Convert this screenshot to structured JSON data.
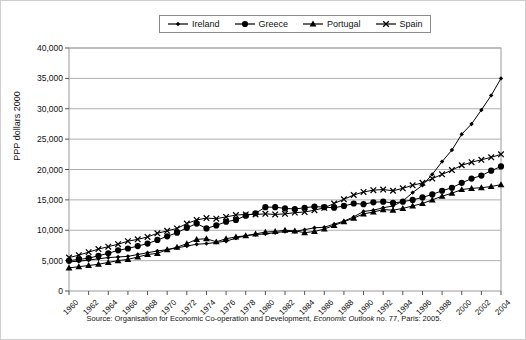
{
  "chart_data": {
    "type": "line",
    "title": "",
    "subtitle": "",
    "xlabel": "",
    "ylabel": "PPP dollars 2000",
    "xlim": [
      1960,
      2004
    ],
    "ylim": [
      0,
      40000
    ],
    "ytick_values": [
      0,
      5000,
      10000,
      15000,
      20000,
      25000,
      30000,
      35000,
      40000
    ],
    "ytick_labels": [
      "0",
      "5,000",
      "10,000",
      "15,000",
      "20,000",
      "25,000",
      "30,000",
      "35,000",
      "40,000"
    ],
    "xtick_labels": [
      "1960",
      "1962",
      "1964",
      "1966",
      "1968",
      "1970",
      "1972",
      "1974",
      "1976",
      "1978",
      "1980",
      "1982",
      "1984",
      "1986",
      "1988",
      "1990",
      "1992",
      "1994",
      "1996",
      "1998",
      "2000",
      "2002",
      "2004"
    ],
    "grid": "horizontal",
    "legend_position": "top-center",
    "x": [
      1960,
      1961,
      1962,
      1963,
      1964,
      1965,
      1966,
      1967,
      1968,
      1969,
      1970,
      1971,
      1972,
      1973,
      1974,
      1975,
      1976,
      1977,
      1978,
      1979,
      1980,
      1981,
      1982,
      1983,
      1984,
      1985,
      1986,
      1987,
      1988,
      1989,
      1990,
      1991,
      1992,
      1993,
      1994,
      1995,
      1996,
      1997,
      1998,
      1999,
      2000,
      2001,
      2002,
      2003,
      2004
    ],
    "series": [
      {
        "name": "Ireland",
        "marker": "diamond",
        "values": [
          4800,
          4900,
          5100,
          5300,
          5500,
          5600,
          5700,
          6000,
          6300,
          6600,
          6800,
          7100,
          7400,
          7700,
          7800,
          8000,
          8200,
          8700,
          9100,
          9300,
          9400,
          9600,
          9800,
          9800,
          10100,
          10400,
          10500,
          11000,
          11500,
          12200,
          13100,
          13300,
          13700,
          14000,
          14800,
          16200,
          17400,
          19200,
          21300,
          23200,
          25800,
          27500,
          29800,
          32200,
          35000
        ]
      },
      {
        "name": "Greece",
        "marker": "circle",
        "values": [
          5000,
          5200,
          5400,
          5800,
          6200,
          6700,
          7000,
          7400,
          7800,
          8400,
          9000,
          9600,
          10400,
          11100,
          10300,
          10800,
          11400,
          11700,
          12400,
          12800,
          13800,
          13800,
          13600,
          13500,
          13700,
          13900,
          13800,
          13700,
          14000,
          14400,
          14300,
          14600,
          14700,
          14500,
          14700,
          15000,
          15400,
          15900,
          16500,
          17000,
          17800,
          18500,
          19000,
          19800,
          20500
        ]
      },
      {
        "name": "Portugal",
        "marker": "triangle",
        "values": [
          3800,
          4000,
          4200,
          4400,
          4700,
          5000,
          5200,
          5600,
          6000,
          6200,
          6800,
          7200,
          7800,
          8500,
          8600,
          8100,
          8600,
          8900,
          9100,
          9400,
          9700,
          9800,
          10000,
          9900,
          9600,
          9800,
          10200,
          10800,
          11400,
          12000,
          12700,
          13000,
          13400,
          13300,
          13600,
          14000,
          14400,
          15000,
          15600,
          16100,
          16700,
          16900,
          17000,
          17200,
          17500
        ]
      },
      {
        "name": "Spain",
        "marker": "cross",
        "values": [
          5500,
          5900,
          6400,
          6900,
          7300,
          7700,
          8200,
          8500,
          8900,
          9500,
          9900,
          10300,
          11100,
          11700,
          12000,
          11900,
          12200,
          12500,
          12600,
          12600,
          12700,
          12600,
          12700,
          12900,
          13000,
          13300,
          13700,
          14400,
          15100,
          15800,
          16300,
          16600,
          16700,
          16500,
          16900,
          17400,
          17800,
          18500,
          19200,
          19900,
          20700,
          21200,
          21600,
          22000,
          22500
        ]
      }
    ]
  },
  "legend": {
    "items": [
      {
        "label": "Ireland",
        "marker": "diamond"
      },
      {
        "label": "Greece",
        "marker": "circle"
      },
      {
        "label": "Portugal",
        "marker": "triangle"
      },
      {
        "label": "Spain",
        "marker": "cross"
      }
    ]
  },
  "source": {
    "prefix": "Source: Organisation for Economic Co-operation and Development, ",
    "italic": "Economic Outlook",
    "suffix": " no. 77, Paris: 2005."
  }
}
